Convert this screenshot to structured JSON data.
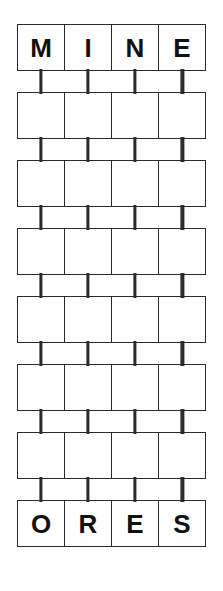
{
  "puzzle": {
    "type": "word-ladder",
    "columns": 4,
    "rows": 8,
    "top_word": "MINE",
    "bottom_word": "ORES",
    "connectors_per_gap": 4,
    "colors": {
      "page_background": "#ffffff",
      "box_fill": "#ffffff",
      "box_border": "#2b2b2b",
      "letter": "#111111"
    },
    "grid": [
      {
        "index": 0,
        "filled": true,
        "letters": [
          "M",
          "I",
          "N",
          "E"
        ]
      },
      {
        "index": 1,
        "filled": false,
        "letters": [
          "",
          "",
          "",
          ""
        ]
      },
      {
        "index": 2,
        "filled": false,
        "letters": [
          "",
          "",
          "",
          ""
        ]
      },
      {
        "index": 3,
        "filled": false,
        "letters": [
          "",
          "",
          "",
          ""
        ]
      },
      {
        "index": 4,
        "filled": false,
        "letters": [
          "",
          "",
          "",
          ""
        ]
      },
      {
        "index": 5,
        "filled": false,
        "letters": [
          "",
          "",
          "",
          ""
        ]
      },
      {
        "index": 6,
        "filled": false,
        "letters": [
          "",
          "",
          "",
          ""
        ]
      },
      {
        "index": 7,
        "filled": true,
        "letters": [
          "O",
          "R",
          "E",
          "S"
        ]
      }
    ]
  }
}
